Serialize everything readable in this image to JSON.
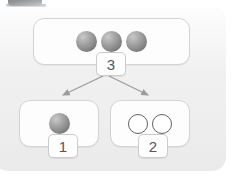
{
  "diagram": {
    "panel": {
      "background_color": "#efefef",
      "border_radius": "14px"
    },
    "corner_tab": {
      "name": "corner-tab",
      "color": "#7d8184"
    },
    "groups": [
      {
        "id": "top",
        "badge_label": "3",
        "item_count": 3,
        "item_style": "filled-sphere",
        "items": [
          "sphere",
          "sphere",
          "sphere"
        ]
      },
      {
        "id": "left",
        "badge_label": "1",
        "item_count": 1,
        "item_style": "filled-sphere",
        "items": [
          "sphere"
        ]
      },
      {
        "id": "right",
        "badge_label": "2",
        "item_count": 2,
        "item_style": "hollow-circle",
        "items": [
          "ring",
          "ring"
        ]
      }
    ],
    "connectors": [
      {
        "id": "arrow-left",
        "from": "top",
        "to": "left",
        "style": "solid-arrow"
      },
      {
        "id": "arrow-right",
        "from": "top",
        "to": "right",
        "style": "solid-arrow"
      }
    ],
    "colors": {
      "sphere_fill": "#8c8c8c",
      "ring_stroke": "#5d6164",
      "box_border": "#d2d4d5",
      "badge_text": "#55585a",
      "arrow": "#9a9c9e"
    }
  }
}
